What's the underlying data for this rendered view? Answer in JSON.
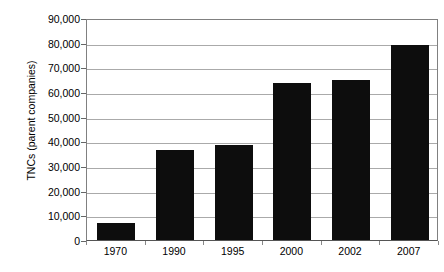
{
  "chart_data": {
    "type": "bar",
    "title": "",
    "subtitle": "",
    "xlabel": "",
    "ylabel": "TNCs (parent companies)",
    "categories": [
      "1970",
      "1990",
      "1995",
      "2000",
      "2002",
      "2007"
    ],
    "values": [
      7000,
      36500,
      38500,
      63800,
      65000,
      79000
    ],
    "ylim": [
      0,
      90000
    ],
    "ytick_values": [
      0,
      10000,
      20000,
      30000,
      40000,
      50000,
      60000,
      70000,
      80000,
      90000
    ],
    "ytick_labels": [
      "0",
      "10,000",
      "20,000",
      "30,000",
      "40,000",
      "50,000",
      "60,000",
      "70,000",
      "80,000",
      "90,000"
    ],
    "grid": true,
    "grid_axis": "y",
    "legend": false,
    "legend_position": "none",
    "bar_color": "#0d0d0d",
    "gridline_color": "#aaaaaa",
    "axis_color": "#808080",
    "background_color": "#ffffff",
    "series": [
      {
        "name": "TNCs (parent companies)",
        "values": [
          7000,
          36500,
          38500,
          63800,
          65000,
          79000
        ]
      }
    ]
  }
}
